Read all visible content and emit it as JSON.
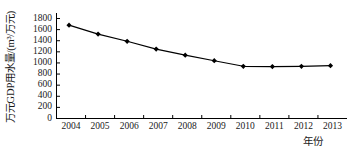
{
  "chart_data": {
    "type": "line",
    "title": "",
    "subtitle": "",
    "xlabel": "年份",
    "ylabel": "万元GDP用水量/(m³/万元)",
    "categories": [
      "2004",
      "2005",
      "2006",
      "2007",
      "2008",
      "2009",
      "2010",
      "2011",
      "2012",
      "2013"
    ],
    "x": [
      2004,
      2005,
      2006,
      2007,
      2008,
      2009,
      2010,
      2011,
      2012,
      2013
    ],
    "values": [
      1680,
      1520,
      1390,
      1250,
      1140,
      1040,
      940,
      935,
      940,
      950
    ],
    "series": [
      {
        "name": "万元GDP用水量",
        "values": [
          1680,
          1520,
          1390,
          1250,
          1140,
          1040,
          940,
          935,
          940,
          950
        ]
      }
    ],
    "ylim": [
      0,
      1800
    ],
    "yticks": [
      0,
      200,
      400,
      600,
      800,
      1000,
      1200,
      1400,
      1600,
      1800
    ],
    "ytick_labels": [
      "0",
      "200",
      "400",
      "600",
      "800",
      "1000",
      "1200",
      "1400",
      "1600",
      "1800"
    ],
    "xlim": [
      2003.5,
      2013.5
    ],
    "grid": false,
    "legend": false,
    "legend_position": "none",
    "marker": "diamond",
    "line_color": "#000000",
    "marker_color": "#000000",
    "background_color": "#ffffff",
    "axis_color": "#000000"
  }
}
